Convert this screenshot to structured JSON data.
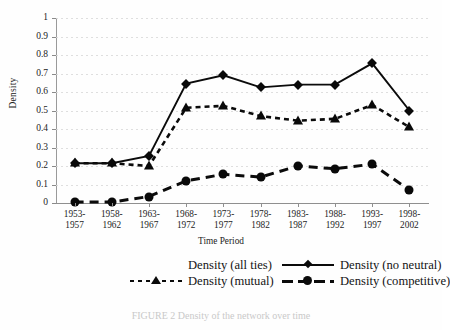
{
  "chart_data": {
    "type": "line",
    "title": "",
    "xlabel": "Time Period",
    "ylabel": "Density",
    "ylim": [
      0,
      1
    ],
    "yticks": [
      "0",
      "0.1",
      "0.2",
      "0.3",
      "0.4",
      "0.5",
      "0.6",
      "0.7",
      "0.8",
      "0.9",
      "1"
    ],
    "ytick_values": [
      0,
      0.1,
      0.2,
      0.3,
      0.4,
      0.5,
      0.6,
      0.7,
      0.8,
      0.9,
      1
    ],
    "grid": true,
    "legend_position": "bottom",
    "categories": [
      "1953-\n1957",
      "1958-\n1962",
      "1963-\n1967",
      "1968-\n1972",
      "1973-\n1977",
      "1978-\n1982",
      "1983-\n1987",
      "1988-\n1992",
      "1993-\n1997",
      "1998-\n2002"
    ],
    "categories_line1": [
      "1953-",
      "1958-",
      "1963-",
      "1968-",
      "1973-",
      "1978-",
      "1983-",
      "1988-",
      "1993-",
      "1998-"
    ],
    "categories_line2": [
      "1957",
      "1962",
      "1967",
      "1972",
      "1977",
      "1982",
      "1987",
      "1992",
      "1997",
      "2002"
    ],
    "series": [
      {
        "name": "Density (all ties)",
        "marker": "none",
        "line": "none",
        "values": [
          null,
          null,
          null,
          null,
          null,
          null,
          null,
          null,
          null,
          null
        ]
      },
      {
        "name": "Density (no neutral)",
        "marker": "diamond",
        "line": "solid",
        "values": [
          0.215,
          0.215,
          0.255,
          0.645,
          0.69,
          0.625,
          0.64,
          0.64,
          0.755,
          0.5
        ]
      },
      {
        "name": "Density (mutual)",
        "marker": "triangle",
        "line": "dashed",
        "values": [
          0.215,
          0.215,
          0.2,
          0.515,
          0.525,
          0.47,
          0.445,
          0.455,
          0.53,
          0.41
        ]
      },
      {
        "name": "Density (competitive)",
        "marker": "circle",
        "line": "dashed-long",
        "values": [
          0.005,
          0.005,
          0.035,
          0.12,
          0.155,
          0.14,
          0.2,
          0.185,
          0.21,
          0.07
        ]
      }
    ]
  },
  "axes": {
    "ylabel": "Density",
    "xlabel": "Time Period"
  },
  "legend": {
    "entries": [
      {
        "label": "Density (all ties)",
        "style": "none",
        "marker": "none"
      },
      {
        "label": "Density (no neutral)",
        "style": "solid",
        "marker": "diamond"
      },
      {
        "label": "Density (mutual)",
        "style": "dash-sm",
        "marker": "triangle"
      },
      {
        "label": "Density (competitive)",
        "style": "dash-lg",
        "marker": "circle"
      }
    ]
  },
  "caption": {
    "text": "FIGURE 2 Density of the network over time"
  },
  "colors": {
    "ink": "#0b0b0b",
    "grid": "#d9d9d9",
    "axis": "#8f8f8f",
    "text": "#232323"
  }
}
